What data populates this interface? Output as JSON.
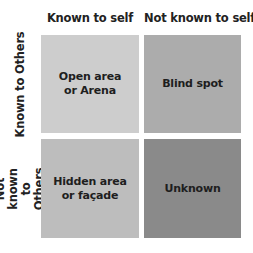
{
  "diagram": {
    "type": "johari-window",
    "column_headers": [
      "Known to self",
      "Not known to self"
    ],
    "row_headers": [
      "Known to Others",
      "Not known\nto Others"
    ],
    "cells": [
      {
        "label": "Open area\nor Arena",
        "color": "#cdcdcd"
      },
      {
        "label": "Blind spot",
        "color": "#acacac"
      },
      {
        "label": "Hidden area\nor façade",
        "color": "#bdbdbd"
      },
      {
        "label": "Unknown",
        "color": "#8a8a8a"
      }
    ]
  }
}
